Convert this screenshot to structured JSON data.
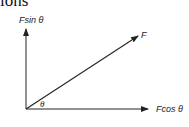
{
  "heading": {
    "text": "ions"
  },
  "diagram": {
    "type": "vector-resolution",
    "vector_label": "F",
    "y_component_label": "Fsin θ",
    "x_component_label": "Fcos θ",
    "angle_label": "θ",
    "line_color": "#222222"
  }
}
